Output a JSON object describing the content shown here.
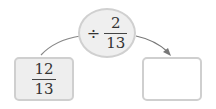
{
  "diagram": {
    "operation": {
      "sign": "÷",
      "numerator": "2",
      "denominator": "13"
    },
    "input": {
      "numerator": "12",
      "denominator": "13"
    },
    "output": {
      "value": ""
    },
    "colors": {
      "box_fill": "#eeeeee",
      "border": "#cfcfcf",
      "arrow": "#777777"
    }
  }
}
